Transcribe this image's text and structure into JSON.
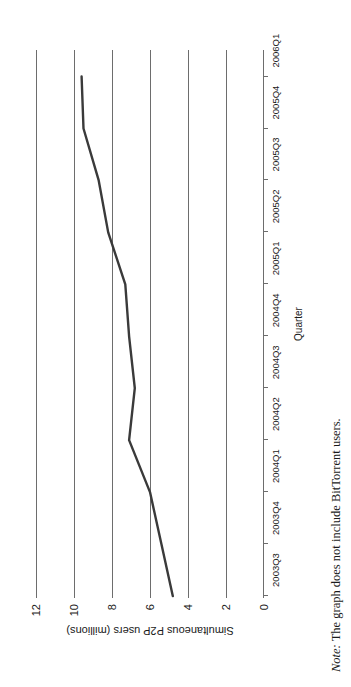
{
  "figure": {
    "note_lead": "Note:",
    "note_body": " The graph does not include BitTorrent users.",
    "orientation": "rotated-90-ccw"
  },
  "chart_data": {
    "type": "line",
    "title": "",
    "xlabel": "Quarter",
    "ylabel": "Simultaneous P2P users (millions)",
    "categories": [
      "2003Q3",
      "2003Q4",
      "2004Q1",
      "2004Q2",
      "2004Q3",
      "2004Q4",
      "2005Q1",
      "2005Q2",
      "2005Q3",
      "2005Q4",
      "2006Q1"
    ],
    "values": [
      4.8,
      5.4,
      6.0,
      7.1,
      6.8,
      7.1,
      7.3,
      8.2,
      8.7,
      9.5,
      9.6
    ],
    "ylim": [
      0,
      12
    ],
    "yticks": [
      0,
      2,
      4,
      6,
      8,
      10,
      12
    ],
    "ytick_labels": [
      "0",
      "2",
      "4",
      "6",
      "8",
      "10",
      "12"
    ],
    "grid": "horizontal",
    "legend": "none",
    "line_color": "#3a3a3a",
    "line_width": 2.4,
    "axis_color": "#6d6d6d"
  }
}
